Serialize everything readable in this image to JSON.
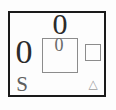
{
  "figure": {
    "top_value": "0",
    "left_value": "0",
    "center_box_value": "0",
    "s_label": "S"
  },
  "icons": {
    "triangle_glyph": "△"
  },
  "colors": {
    "background": "#fdfdfd",
    "outer_border": "#1a1a1a",
    "digit_dark": "#2b2b2b",
    "digit_gray": "#696969",
    "letter_gray": "#5f5f5f",
    "shape_border": "#8c8c8c",
    "triangle_gray": "#9a9a9a"
  }
}
